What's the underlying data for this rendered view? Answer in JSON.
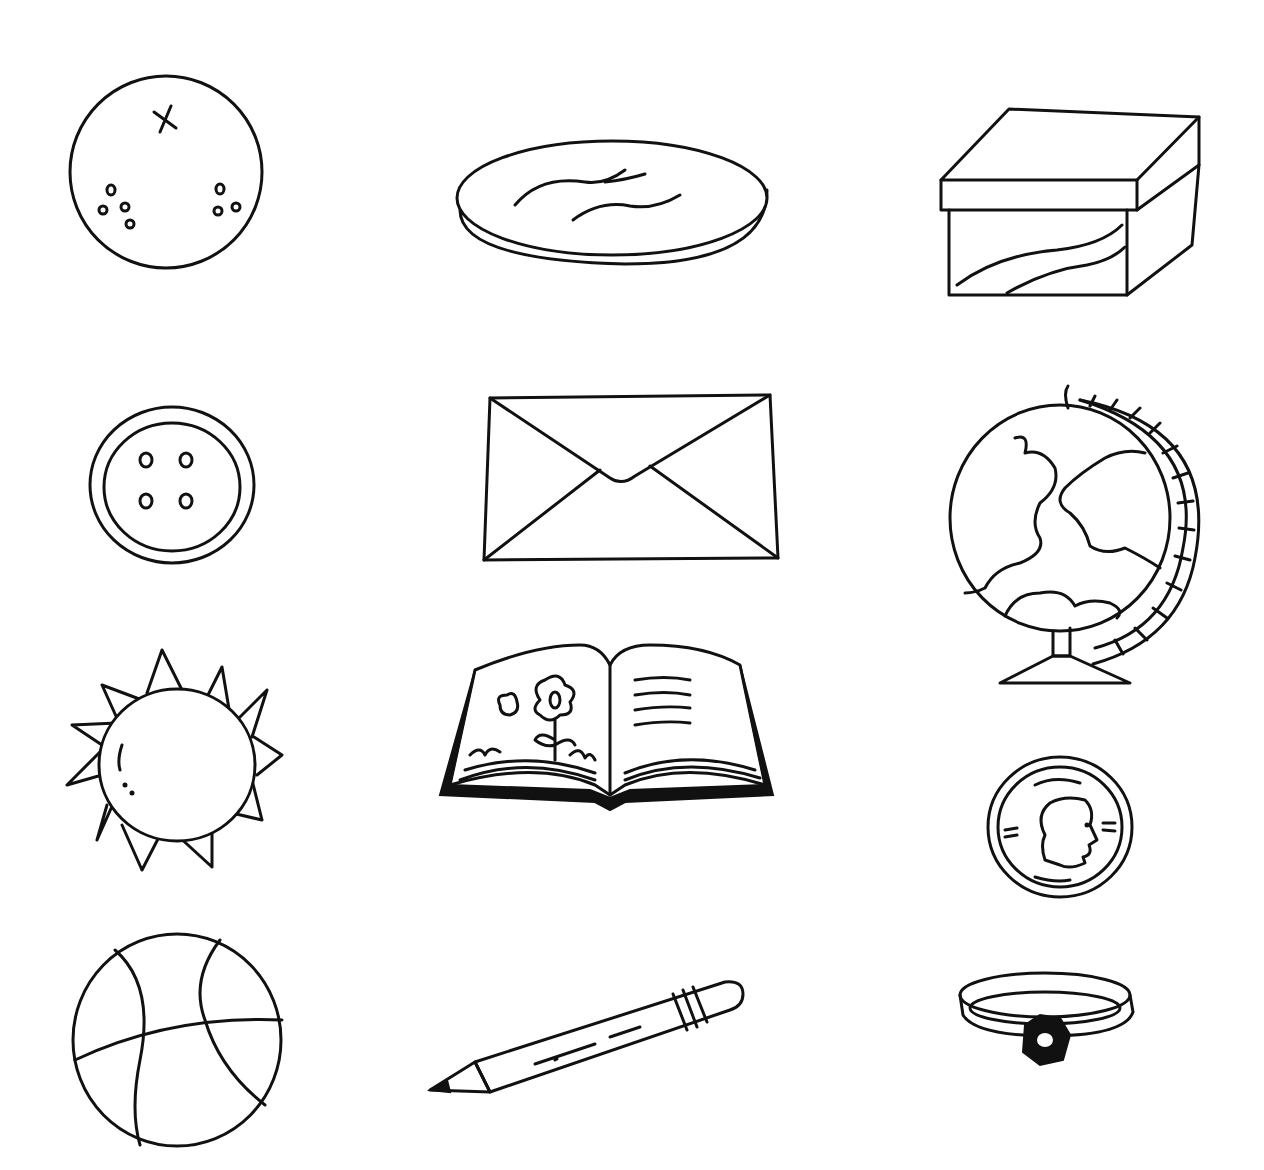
{
  "page": {
    "background": "#ffffff",
    "ink_color": "#111111"
  },
  "items": [
    {
      "id": "orange",
      "label": "Orange",
      "shape": "circle"
    },
    {
      "id": "cookie",
      "label": "Cookie",
      "shape": "circle"
    },
    {
      "id": "box",
      "label": "Box",
      "shape": "rectangular prism"
    },
    {
      "id": "button",
      "label": "Button",
      "shape": "circle"
    },
    {
      "id": "envelope",
      "label": "Envelope",
      "shape": "rectangle"
    },
    {
      "id": "globe",
      "label": "Globe",
      "shape": "sphere"
    },
    {
      "id": "sun",
      "label": "Sun",
      "shape": "circle"
    },
    {
      "id": "book",
      "label": "Book",
      "shape": "rectangle"
    },
    {
      "id": "coin",
      "label": "Coin",
      "shape": "circle"
    },
    {
      "id": "ball",
      "label": "Basketball",
      "shape": "sphere"
    },
    {
      "id": "pencil",
      "label": "Pencil",
      "shape": "cylinder"
    },
    {
      "id": "ring",
      "label": "Ring",
      "shape": "circle"
    }
  ]
}
